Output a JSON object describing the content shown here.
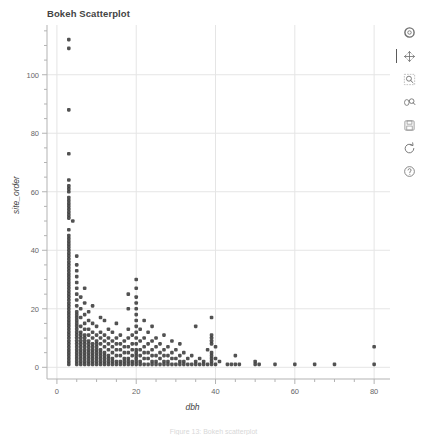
{
  "figure": {
    "caption": "Figure 13: Bokeh scatterplot"
  },
  "plot": {
    "title": "Bokeh Scatterplot",
    "background": "#ffffff",
    "grid_color": "#e5e5e5",
    "axis_color": "#b3b3b3",
    "marker_color": "#3a3a3a"
  },
  "toolbar": {
    "position": "right",
    "tools": [
      {
        "name": "bokeh-logo-icon",
        "label": "Bokeh",
        "active": false
      },
      {
        "name": "pan-tool-icon",
        "label": "Pan",
        "active": true
      },
      {
        "name": "box-zoom-tool-icon",
        "label": "Box Zoom",
        "active": false
      },
      {
        "name": "wheel-zoom-tool-icon",
        "label": "Wheel Zoom",
        "active": false
      },
      {
        "name": "save-tool-icon",
        "label": "Save",
        "active": false
      },
      {
        "name": "reset-tool-icon",
        "label": "Reset",
        "active": false
      },
      {
        "name": "help-tool-icon",
        "label": "Help",
        "active": false
      }
    ]
  },
  "chart_data": {
    "type": "scatter",
    "title": "Bokeh Scatterplot",
    "xlabel": "dbh",
    "ylabel": "site_order",
    "xlim": [
      -2.5,
      84
    ],
    "ylim": [
      -4,
      117
    ],
    "xticks": [
      0,
      20,
      40,
      60,
      80
    ],
    "yticks": [
      0,
      20,
      40,
      60,
      80,
      100
    ],
    "xminor_step": 5,
    "yminor_step": 5,
    "grid": true,
    "legend": null,
    "marker": "circle",
    "marker_size": 2.6,
    "points": [
      [
        3,
        112
      ],
      [
        3,
        109
      ],
      [
        3,
        88
      ],
      [
        3,
        73
      ],
      [
        3,
        64
      ],
      [
        3,
        62
      ],
      [
        3,
        61
      ],
      [
        3,
        60
      ],
      [
        3,
        58
      ],
      [
        3,
        57
      ],
      [
        3,
        56
      ],
      [
        3,
        55
      ],
      [
        3,
        54
      ],
      [
        3,
        53
      ],
      [
        3,
        52
      ],
      [
        3,
        51
      ],
      [
        4,
        50
      ],
      [
        3,
        47
      ],
      [
        3,
        45
      ],
      [
        3,
        44
      ],
      [
        3,
        43
      ],
      [
        3,
        42
      ],
      [
        3,
        41
      ],
      [
        3,
        40
      ],
      [
        3,
        39
      ],
      [
        3,
        38
      ],
      [
        3,
        37
      ],
      [
        3,
        36
      ],
      [
        3,
        35
      ],
      [
        3,
        34
      ],
      [
        3,
        33
      ],
      [
        3,
        32
      ],
      [
        3,
        31
      ],
      [
        3,
        30
      ],
      [
        3,
        29
      ],
      [
        3,
        28
      ],
      [
        3,
        27
      ],
      [
        3,
        26
      ],
      [
        3,
        25
      ],
      [
        3,
        24
      ],
      [
        3,
        23
      ],
      [
        3,
        22
      ],
      [
        3,
        21
      ],
      [
        3,
        20
      ],
      [
        3,
        19
      ],
      [
        3,
        18
      ],
      [
        3,
        17
      ],
      [
        3,
        16
      ],
      [
        3,
        15
      ],
      [
        3,
        14
      ],
      [
        3,
        13
      ],
      [
        3,
        12
      ],
      [
        3,
        11
      ],
      [
        3,
        10
      ],
      [
        3,
        9
      ],
      [
        3,
        8
      ],
      [
        3,
        7
      ],
      [
        3,
        6
      ],
      [
        3,
        5
      ],
      [
        3,
        4
      ],
      [
        3,
        3
      ],
      [
        3,
        2
      ],
      [
        3,
        1
      ],
      [
        5,
        38
      ],
      [
        5,
        35
      ],
      [
        5,
        33
      ],
      [
        5,
        31
      ],
      [
        5,
        29
      ],
      [
        5,
        27
      ],
      [
        5,
        25
      ],
      [
        5,
        23
      ],
      [
        5,
        21
      ],
      [
        5,
        19
      ],
      [
        5,
        18
      ],
      [
        5,
        17
      ],
      [
        5,
        16
      ],
      [
        5,
        15
      ],
      [
        5,
        14
      ],
      [
        5,
        13
      ],
      [
        5,
        12
      ],
      [
        5,
        11
      ],
      [
        5,
        10
      ],
      [
        5,
        9
      ],
      [
        5,
        8
      ],
      [
        5,
        7
      ],
      [
        5,
        6
      ],
      [
        5,
        5
      ],
      [
        5,
        4
      ],
      [
        5,
        3
      ],
      [
        5,
        2
      ],
      [
        5,
        1
      ],
      [
        6,
        24
      ],
      [
        6,
        20
      ],
      [
        6,
        17
      ],
      [
        6,
        14
      ],
      [
        6,
        12
      ],
      [
        6,
        11
      ],
      [
        6,
        10
      ],
      [
        6,
        9
      ],
      [
        6,
        8
      ],
      [
        6,
        7
      ],
      [
        6,
        6
      ],
      [
        6,
        5
      ],
      [
        6,
        4
      ],
      [
        6,
        3
      ],
      [
        6,
        2
      ],
      [
        6,
        1
      ],
      [
        7,
        27
      ],
      [
        7,
        22
      ],
      [
        7,
        18
      ],
      [
        7,
        15
      ],
      [
        7,
        13
      ],
      [
        7,
        11
      ],
      [
        7,
        10
      ],
      [
        7,
        9
      ],
      [
        7,
        8
      ],
      [
        7,
        7
      ],
      [
        7,
        6
      ],
      [
        7,
        5
      ],
      [
        7,
        4
      ],
      [
        7,
        3
      ],
      [
        7,
        2
      ],
      [
        7,
        1
      ],
      [
        8,
        19
      ],
      [
        8,
        16
      ],
      [
        8,
        13
      ],
      [
        8,
        11
      ],
      [
        8,
        9
      ],
      [
        8,
        8
      ],
      [
        8,
        7
      ],
      [
        8,
        6
      ],
      [
        8,
        5
      ],
      [
        8,
        4
      ],
      [
        8,
        3
      ],
      [
        8,
        2
      ],
      [
        8,
        1
      ],
      [
        9,
        21
      ],
      [
        9,
        15
      ],
      [
        9,
        12
      ],
      [
        9,
        10
      ],
      [
        9,
        8
      ],
      [
        9,
        7
      ],
      [
        9,
        6
      ],
      [
        9,
        5
      ],
      [
        9,
        4
      ],
      [
        9,
        3
      ],
      [
        9,
        2
      ],
      [
        9,
        1
      ],
      [
        10,
        14
      ],
      [
        10,
        11
      ],
      [
        10,
        9
      ],
      [
        10,
        8
      ],
      [
        10,
        7
      ],
      [
        10,
        6
      ],
      [
        10,
        5
      ],
      [
        10,
        4
      ],
      [
        10,
        3
      ],
      [
        10,
        2
      ],
      [
        10,
        1
      ],
      [
        11,
        17
      ],
      [
        11,
        12
      ],
      [
        11,
        10
      ],
      [
        11,
        8
      ],
      [
        11,
        6
      ],
      [
        11,
        5
      ],
      [
        11,
        4
      ],
      [
        11,
        3
      ],
      [
        11,
        2
      ],
      [
        11,
        1
      ],
      [
        12,
        16
      ],
      [
        12,
        11
      ],
      [
        12,
        9
      ],
      [
        12,
        7
      ],
      [
        12,
        5
      ],
      [
        12,
        4
      ],
      [
        12,
        3
      ],
      [
        12,
        2
      ],
      [
        12,
        1
      ],
      [
        13,
        13
      ],
      [
        13,
        10
      ],
      [
        13,
        8
      ],
      [
        13,
        6
      ],
      [
        13,
        4
      ],
      [
        13,
        3
      ],
      [
        13,
        2
      ],
      [
        13,
        1
      ],
      [
        14,
        12
      ],
      [
        14,
        9
      ],
      [
        14,
        7
      ],
      [
        14,
        5
      ],
      [
        14,
        3
      ],
      [
        14,
        2
      ],
      [
        14,
        1
      ],
      [
        15,
        15
      ],
      [
        15,
        10
      ],
      [
        15,
        8
      ],
      [
        15,
        6
      ],
      [
        15,
        4
      ],
      [
        15,
        2
      ],
      [
        15,
        1
      ],
      [
        16,
        11
      ],
      [
        16,
        8
      ],
      [
        16,
        6
      ],
      [
        16,
        4
      ],
      [
        16,
        2
      ],
      [
        16,
        1
      ],
      [
        17,
        9
      ],
      [
        17,
        7
      ],
      [
        17,
        5
      ],
      [
        17,
        3
      ],
      [
        17,
        2
      ],
      [
        17,
        1
      ],
      [
        18,
        25
      ],
      [
        18,
        20
      ],
      [
        18,
        13
      ],
      [
        18,
        10
      ],
      [
        18,
        7
      ],
      [
        18,
        5
      ],
      [
        18,
        3
      ],
      [
        18,
        2
      ],
      [
        18,
        1
      ],
      [
        19,
        11
      ],
      [
        19,
        8
      ],
      [
        19,
        6
      ],
      [
        19,
        4
      ],
      [
        19,
        2
      ],
      [
        19,
        1
      ],
      [
        20,
        30
      ],
      [
        20,
        27
      ],
      [
        20,
        24
      ],
      [
        20,
        22
      ],
      [
        20,
        20
      ],
      [
        20,
        18
      ],
      [
        20,
        16
      ],
      [
        20,
        14
      ],
      [
        20,
        12
      ],
      [
        20,
        10
      ],
      [
        20,
        8
      ],
      [
        20,
        6
      ],
      [
        20,
        5
      ],
      [
        20,
        4
      ],
      [
        20,
        3
      ],
      [
        20,
        2
      ],
      [
        20,
        1
      ],
      [
        21,
        13
      ],
      [
        21,
        9
      ],
      [
        21,
        6
      ],
      [
        21,
        4
      ],
      [
        21,
        2
      ],
      [
        21,
        1
      ],
      [
        22,
        16
      ],
      [
        22,
        10
      ],
      [
        22,
        7
      ],
      [
        22,
        5
      ],
      [
        22,
        3
      ],
      [
        22,
        1
      ],
      [
        23,
        12
      ],
      [
        23,
        8
      ],
      [
        23,
        5
      ],
      [
        23,
        3
      ],
      [
        23,
        1
      ],
      [
        24,
        14
      ],
      [
        24,
        9
      ],
      [
        24,
        6
      ],
      [
        24,
        4
      ],
      [
        24,
        2
      ],
      [
        24,
        1
      ],
      [
        25,
        10
      ],
      [
        25,
        7
      ],
      [
        25,
        4
      ],
      [
        25,
        2
      ],
      [
        25,
        1
      ],
      [
        26,
        8
      ],
      [
        26,
        5
      ],
      [
        26,
        3
      ],
      [
        26,
        1
      ],
      [
        27,
        11
      ],
      [
        27,
        6
      ],
      [
        27,
        4
      ],
      [
        27,
        2
      ],
      [
        27,
        1
      ],
      [
        28,
        7
      ],
      [
        28,
        4
      ],
      [
        28,
        2
      ],
      [
        28,
        1
      ],
      [
        29,
        9
      ],
      [
        29,
        5
      ],
      [
        29,
        3
      ],
      [
        29,
        1
      ],
      [
        30,
        6
      ],
      [
        30,
        3
      ],
      [
        30,
        1
      ],
      [
        31,
        8
      ],
      [
        31,
        4
      ],
      [
        31,
        2
      ],
      [
        31,
        1
      ],
      [
        32,
        5
      ],
      [
        32,
        2
      ],
      [
        32,
        1
      ],
      [
        33,
        3
      ],
      [
        33,
        1
      ],
      [
        34,
        4
      ],
      [
        34,
        1
      ],
      [
        35,
        14
      ],
      [
        35,
        2
      ],
      [
        35,
        1
      ],
      [
        36,
        3
      ],
      [
        36,
        1
      ],
      [
        37,
        2
      ],
      [
        37,
        1
      ],
      [
        38,
        6
      ],
      [
        38,
        1
      ],
      [
        39,
        17
      ],
      [
        39,
        11
      ],
      [
        39,
        10
      ],
      [
        39,
        9
      ],
      [
        39,
        8
      ],
      [
        39,
        5
      ],
      [
        39,
        4
      ],
      [
        39,
        3
      ],
      [
        39,
        2
      ],
      [
        39,
        1
      ],
      [
        40,
        7
      ],
      [
        40,
        3
      ],
      [
        40,
        1
      ],
      [
        41,
        2
      ],
      [
        43,
        1
      ],
      [
        44,
        1
      ],
      [
        45,
        4
      ],
      [
        45,
        1
      ],
      [
        46,
        1
      ],
      [
        50,
        2
      ],
      [
        50,
        1
      ],
      [
        51,
        1
      ],
      [
        55,
        1
      ],
      [
        60,
        1
      ],
      [
        65,
        1
      ],
      [
        70,
        1
      ],
      [
        80,
        7
      ],
      [
        80,
        1
      ]
    ]
  }
}
